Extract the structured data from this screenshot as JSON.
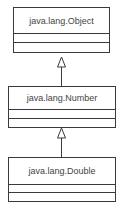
{
  "diagram": {
    "type": "uml-class-hierarchy",
    "classes": [
      {
        "name": "java.lang.Object"
      },
      {
        "name": "java.lang.Number"
      },
      {
        "name": "java.lang.Double"
      }
    ],
    "relationships": [
      {
        "from": "java.lang.Number",
        "to": "java.lang.Object",
        "type": "generalization"
      },
      {
        "from": "java.lang.Double",
        "to": "java.lang.Number",
        "type": "generalization"
      }
    ],
    "colors": {
      "line": "#3a3a3a",
      "text": "#444444",
      "background": "#ffffff"
    }
  }
}
